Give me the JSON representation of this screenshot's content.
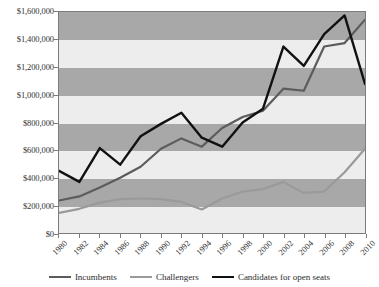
{
  "chart_data": {
    "type": "line",
    "title": "",
    "xlabel": "",
    "ylabel": "",
    "x": [
      1980,
      1982,
      1984,
      1986,
      1988,
      1990,
      1992,
      1994,
      1996,
      1998,
      2000,
      2002,
      2004,
      2006,
      2008,
      2010
    ],
    "categories": [
      "1980",
      "1982",
      "1984",
      "1986",
      "1988",
      "1990",
      "1992",
      "1994",
      "1996",
      "1998",
      "2000",
      "2002",
      "2004",
      "2006",
      "2008",
      "2010"
    ],
    "ylim": [
      0,
      1600000
    ],
    "xlim": [
      1980,
      2010
    ],
    "ytick_step": 200000,
    "ytick_labels": [
      "$0",
      "$200,000",
      "$400,000",
      "$600,000",
      "$800,000",
      "$1,000,000",
      "$1,200,000",
      "$1,400,000",
      "$1,600,000"
    ],
    "ytick_values": [
      0,
      200000,
      400000,
      600000,
      800000,
      1000000,
      1200000,
      1400000,
      1600000
    ],
    "grid": false,
    "banded_background": true,
    "legend_position": "bottom",
    "series": [
      {
        "name": "Incumbents",
        "color": "#5c5c5c",
        "values": [
          235000,
          265000,
          330000,
          400000,
          480000,
          610000,
          685000,
          625000,
          760000,
          840000,
          885000,
          1045000,
          1030000,
          1350000,
          1375000,
          1545000
        ]
      },
      {
        "name": "Challengers",
        "color": "#9a9a9a",
        "values": [
          145000,
          175000,
          220000,
          245000,
          250000,
          245000,
          225000,
          170000,
          250000,
          300000,
          318000,
          370000,
          290000,
          300000,
          440000,
          610000
        ]
      },
      {
        "name": "Candidates for open seats",
        "color": "#111111",
        "values": [
          450000,
          370000,
          615000,
          495000,
          700000,
          790000,
          870000,
          690000,
          625000,
          800000,
          900000,
          1350000,
          1210000,
          1440000,
          1575000,
          1080000
        ]
      }
    ]
  },
  "legend": {
    "items": [
      {
        "label": "Incumbents",
        "color": "#5c5c5c"
      },
      {
        "label": "Challengers",
        "color": "#9a9a9a"
      },
      {
        "label": "Candidates for open seats",
        "color": "#111111"
      }
    ]
  }
}
